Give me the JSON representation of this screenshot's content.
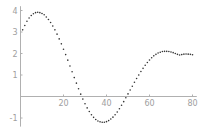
{
  "chart_data": {
    "type": "scatter",
    "title": "",
    "xlabel": "",
    "ylabel": "",
    "xlim": [
      0,
      82
    ],
    "ylim": [
      -1.4,
      4.2
    ],
    "x_ticks": [
      20,
      40,
      60,
      80
    ],
    "y_ticks": [
      -1,
      1,
      2,
      3,
      4
    ],
    "grid": false,
    "legend": null,
    "series": [
      {
        "name": "data",
        "marker_color": "#333333",
        "x": [
          1,
          2,
          3,
          4,
          5,
          6,
          7,
          8,
          9,
          10,
          11,
          12,
          13,
          14,
          15,
          16,
          17,
          18,
          19,
          20,
          21,
          22,
          23,
          24,
          25,
          26,
          27,
          28,
          29,
          30,
          31,
          32,
          33,
          34,
          35,
          36,
          37,
          38,
          39,
          40,
          41,
          42,
          43,
          44,
          45,
          46,
          47,
          48,
          49,
          50,
          51,
          52,
          53,
          54,
          55,
          56,
          57,
          58,
          59,
          60,
          61,
          62,
          63,
          64,
          65,
          66,
          67,
          68,
          69,
          70,
          71,
          72,
          73,
          74,
          75,
          76,
          77,
          78,
          79,
          80
        ],
        "y": [
          3.1,
          3.3,
          3.5,
          3.65,
          3.77,
          3.85,
          3.9,
          3.92,
          3.9,
          3.86,
          3.8,
          3.7,
          3.58,
          3.44,
          3.28,
          3.1,
          2.9,
          2.68,
          2.45,
          2.2,
          1.95,
          1.69,
          1.42,
          1.15,
          0.88,
          0.62,
          0.36,
          0.11,
          -0.12,
          -0.34,
          -0.53,
          -0.7,
          -0.85,
          -0.97,
          -1.07,
          -1.14,
          -1.18,
          -1.2,
          -1.2,
          -1.17,
          -1.12,
          -1.05,
          -0.96,
          -0.85,
          -0.72,
          -0.57,
          -0.41,
          -0.24,
          -0.06,
          0.12,
          0.3,
          0.48,
          0.66,
          0.84,
          1.0,
          1.16,
          1.31,
          1.45,
          1.58,
          1.7,
          1.8,
          1.89,
          1.96,
          2.02,
          2.06,
          2.09,
          2.1,
          2.1,
          2.09,
          2.07,
          2.04,
          2.0,
          1.96,
          1.93,
          1.95,
          1.97,
          1.98,
          1.97,
          1.96,
          1.94
        ]
      }
    ]
  },
  "axes": {
    "x_tick_labels": [
      "20",
      "40",
      "60",
      "80"
    ],
    "y_tick_labels": [
      "4",
      "3",
      "2",
      "1",
      "-1"
    ],
    "axis_color": "#b0b0b0"
  }
}
